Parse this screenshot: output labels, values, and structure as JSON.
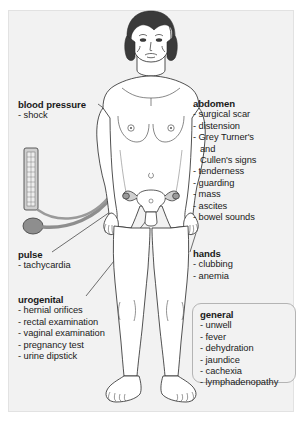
{
  "diagram": {
    "background_color": "#f2f2f2",
    "text_color": "#1a1a1a",
    "line_color": "#333333",
    "cuff_color": "#8e8e8e",
    "hair_color": "#3a3a3a"
  },
  "labels": {
    "blood_pressure": {
      "heading": "blood pressure",
      "items": [
        "- shock"
      ]
    },
    "pulse": {
      "heading": "pulse",
      "items": [
        "- tachycardia"
      ]
    },
    "urogenital": {
      "heading": "urogenital",
      "items": [
        "- hernial orifices",
        "- rectal examination",
        "- vaginal examination",
        "- pregnancy test",
        "- urine dipstick"
      ]
    },
    "abdomen": {
      "heading": "abdomen",
      "items": [
        "- surgical scar",
        "- distension",
        "- Grey Turner's",
        "- tenderness",
        "- guarding",
        "- mass",
        "- ascites",
        "- bowel sounds"
      ],
      "continuation_1": "and",
      "continuation_2": "Cullen's signs"
    },
    "hands": {
      "heading": "hands",
      "items": [
        "- clubbing",
        "- anemia"
      ]
    },
    "general": {
      "heading": "general",
      "items": [
        "- unwell",
        "- fever",
        "- dehydration",
        "- jaundice",
        "- cachexia",
        "- lymphadenopathy"
      ]
    }
  },
  "instruments": {
    "sphygmomanometer": {
      "name": "sphygmomanometer",
      "parts": [
        "manometer-column",
        "cuff",
        "tubing",
        "inflation-bulb"
      ]
    }
  },
  "anatomy_callouts": [
    "head",
    "right-upper-arm-cuff",
    "abdomen",
    "pelvis-uterus-ovaries",
    "left-hand",
    "right-hand",
    "legs",
    "feet"
  ]
}
